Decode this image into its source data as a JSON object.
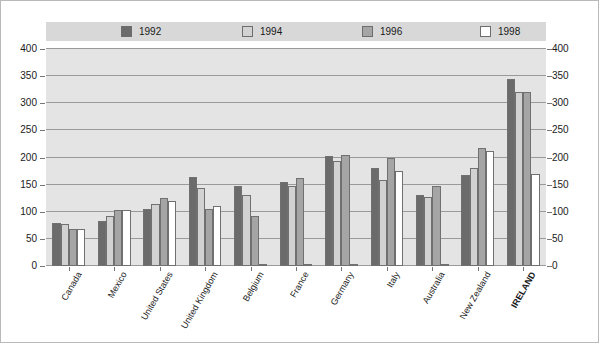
{
  "chart_data": {
    "type": "bar",
    "title": "",
    "xlabel": "",
    "ylabel": "",
    "ylim": [
      0,
      400
    ],
    "ytick_step": 50,
    "yticks": [
      0,
      50,
      100,
      150,
      200,
      250,
      300,
      350,
      400
    ],
    "grid": true,
    "legend_position": "top",
    "dual_y_axis": true,
    "categories": [
      "Canada",
      "Mexico",
      "United States",
      "United Kingdom",
      "Belgium",
      "France",
      "Germany",
      "Italy",
      "Australia",
      "New Zealand",
      "IRELAND"
    ],
    "emphasized_category": "IRELAND",
    "series": [
      {
        "name": "1992",
        "color": "#6b6b6b",
        "values": [
          80,
          83,
          105,
          165,
          147,
          155,
          203,
          180,
          130,
          168,
          345
        ]
      },
      {
        "name": "1994",
        "color": "#d2d2d2",
        "values": [
          78,
          92,
          115,
          143,
          130,
          148,
          193,
          158,
          127,
          180,
          320
        ]
      },
      {
        "name": "1996",
        "color": "#a5a5a5",
        "values": [
          68,
          103,
          125,
          105,
          93,
          163,
          205,
          200,
          148,
          218,
          320
        ]
      },
      {
        "name": "1998",
        "color": "#ffffff",
        "values": [
          68,
          103,
          120,
          110,
          3,
          3,
          3,
          175,
          3,
          212,
          170
        ]
      }
    ]
  },
  "legend": {
    "items": [
      {
        "label": "1992",
        "swatch": "#6b6b6b"
      },
      {
        "label": "1994",
        "swatch": "#d2d2d2"
      },
      {
        "label": "1996",
        "swatch": "#a5a5a5"
      },
      {
        "label": "1998",
        "swatch": "#ffffff"
      }
    ]
  },
  "axis": {
    "left_ticks": [
      "400",
      "350",
      "300",
      "250",
      "200",
      "150",
      "100",
      "50",
      "0"
    ],
    "right_ticks": [
      "400",
      "350",
      "300",
      "250",
      "200",
      "150",
      "100",
      "50",
      "0"
    ]
  },
  "colors": {
    "plot_background": "#e4e4e4",
    "legend_background": "#d8d8d8",
    "gridline": "#9a9a9a",
    "bar_border": "#707070",
    "frame_border": "#b9b9b9",
    "text": "#1a1a1a"
  }
}
